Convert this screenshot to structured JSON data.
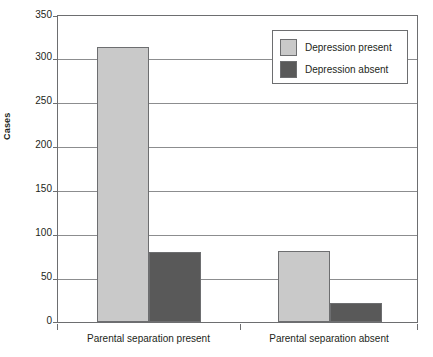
{
  "chart_data": {
    "type": "bar",
    "title": "",
    "xlabel": "",
    "ylabel": "Cases",
    "ylim": [
      0,
      350
    ],
    "ytick_labels": [
      "350",
      "300",
      "250",
      "200",
      "150",
      "100",
      "50",
      "0"
    ],
    "ytick_values": [
      350,
      300,
      250,
      200,
      150,
      100,
      50,
      0
    ],
    "grid": true,
    "categories": [
      "Parental separation present",
      "Parental separation absent"
    ],
    "legend_position": "top-right",
    "series": [
      {
        "name": "Depression present",
        "color": "#c9c9c9",
        "values": [
          315,
          81
        ]
      },
      {
        "name": "Depression absent",
        "color": "#595959",
        "values": [
          80,
          22
        ]
      }
    ]
  },
  "axis": {
    "y_title": "Cases",
    "ticks": [
      {
        "label": "350",
        "value": 350
      },
      {
        "label": "300",
        "value": 300
      },
      {
        "label": "250",
        "value": 250
      },
      {
        "label": "200",
        "value": 200
      },
      {
        "label": "150",
        "value": 150
      },
      {
        "label": "100",
        "value": 100
      },
      {
        "label": "50",
        "value": 50
      },
      {
        "label": "0",
        "value": 0
      }
    ],
    "x_categories": [
      {
        "label": "Parental separation present"
      },
      {
        "label": "Parental separation absent"
      }
    ]
  },
  "legend": {
    "entries": [
      {
        "label": "Depression present",
        "color": "#c9c9c9"
      },
      {
        "label": "Depression absent",
        "color": "#595959"
      }
    ]
  },
  "colors": {
    "series_light": "#c9c9c9",
    "series_dark": "#595959",
    "axis": "#6d6e70",
    "grid": "#8c8d8f",
    "text": "#231f20",
    "background": "#ffffff"
  }
}
